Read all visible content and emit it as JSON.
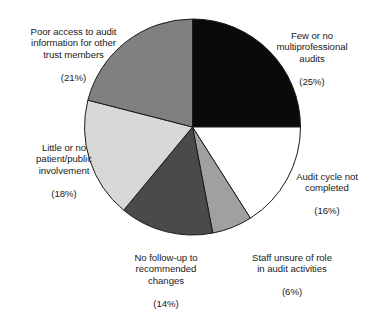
{
  "chart_data": {
    "type": "pie",
    "title": "",
    "subtitle": "",
    "xlabel": "",
    "ylabel": "",
    "legend_position": "none",
    "grid": false,
    "labels_outside": true,
    "start_angle_deg": 0,
    "direction": "clockwise",
    "units": "percent",
    "categories": [
      "Few or no multiprofessional audits",
      "Audit cycle not completed",
      "Staff unsure of role in audit activities",
      "No follow-up to recommended changes",
      "Little or no patient/public involvement",
      "Poor access to audit information for other trust members"
    ],
    "values": [
      25,
      16,
      6,
      14,
      18,
      21
    ],
    "colors": [
      "#0a0a0a",
      "#ffffff",
      "#a0a0a0",
      "#4a4a4a",
      "#d8d8d8",
      "#808080"
    ],
    "slices": [
      {
        "name": "few-or-no-multiprofessional-audits",
        "label_lines": "Few or no\nmultiprofessional\naudits",
        "percent_text": "(25%)",
        "value": 25,
        "color": "#0a0a0a",
        "start_deg": 0,
        "end_deg": 90
      },
      {
        "name": "audit-cycle-not-completed",
        "label_lines": "Audit cycle not\ncompleted",
        "percent_text": "(16%)",
        "value": 16,
        "color": "#ffffff",
        "start_deg": 90,
        "end_deg": 147.6
      },
      {
        "name": "staff-unsure-of-role",
        "label_lines": "Staff unsure of role\nin audit activities",
        "percent_text": "(6%)",
        "value": 6,
        "color": "#a0a0a0",
        "start_deg": 147.6,
        "end_deg": 169.2
      },
      {
        "name": "no-follow-up-to-recommended-changes",
        "label_lines": "No follow-up to\nrecommended\nchanges",
        "percent_text": "(14%)",
        "value": 14,
        "color": "#4a4a4a",
        "start_deg": 169.2,
        "end_deg": 219.6
      },
      {
        "name": "little-or-no-patient-public-involvement",
        "label_lines": "Little or no\npatient/public\ninvolvement",
        "percent_text": "(18%)",
        "value": 18,
        "color": "#d8d8d8",
        "start_deg": 219.6,
        "end_deg": 284.4
      },
      {
        "name": "poor-access-to-audit-information",
        "label_lines": "Poor access to audit\ninformation for other\ntrust members",
        "percent_text": "(21%)",
        "value": 21,
        "color": "#808080",
        "start_deg": 284.4,
        "end_deg": 360
      }
    ],
    "geometry": {
      "center_x": 192.5,
      "center_y": 127,
      "radius": 108,
      "stroke_color": "#1a1a1a",
      "stroke_width": 1
    }
  }
}
